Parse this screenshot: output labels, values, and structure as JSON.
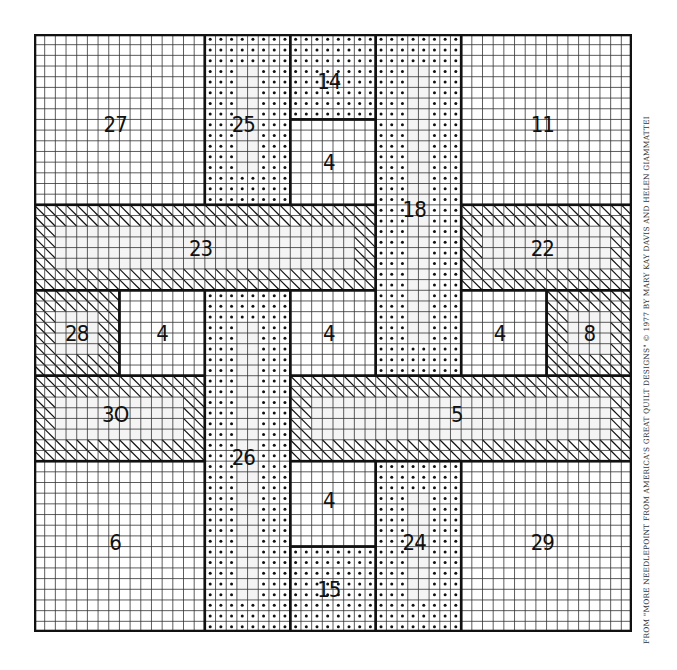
{
  "diagram": {
    "type": "needlepoint-chart",
    "grid": {
      "cells": 56,
      "block_cells": 8,
      "blocks": 7
    },
    "colors": {
      "ink": "#111111",
      "grid": "#333333",
      "fill": "#f4f4f4"
    },
    "regions": [
      {
        "id": "27",
        "label": "27",
        "pattern": "plain",
        "bx": 0,
        "by": 0,
        "bw": 2,
        "bh": 2,
        "lx": 0.95,
        "ly": 1.05
      },
      {
        "id": "25",
        "label": "25",
        "pattern": "dotted",
        "bx": 2,
        "by": 0,
        "bw": 1,
        "bh": 2,
        "lx": 2.45,
        "ly": 1.05
      },
      {
        "id": "14",
        "label": "14",
        "pattern": "dotted",
        "bx": 3,
        "by": 0,
        "bw": 1,
        "bh": 1,
        "lx": 3.45,
        "ly": 0.55
      },
      {
        "id": "4a",
        "label": "4",
        "pattern": "plain",
        "bx": 3,
        "by": 1,
        "bw": 1,
        "bh": 1,
        "lx": 3.45,
        "ly": 1.5
      },
      {
        "id": "18",
        "label": "18",
        "pattern": "dotted",
        "bx": 4,
        "by": 0,
        "bw": 1,
        "bh": 4,
        "lx": 4.45,
        "ly": 2.05
      },
      {
        "id": "11",
        "label": "11",
        "pattern": "plain",
        "bx": 5,
        "by": 0,
        "bw": 2,
        "bh": 2,
        "lx": 5.95,
        "ly": 1.05
      },
      {
        "id": "23",
        "label": "23",
        "pattern": "hatched",
        "bx": 0,
        "by": 2,
        "bw": 4,
        "bh": 1,
        "lx": 1.95,
        "ly": 2.5
      },
      {
        "id": "22",
        "label": "22",
        "pattern": "hatched",
        "bx": 5,
        "by": 2,
        "bw": 2,
        "bh": 1,
        "lx": 5.95,
        "ly": 2.5
      },
      {
        "id": "28",
        "label": "28",
        "pattern": "hatched",
        "bx": 0,
        "by": 3,
        "bw": 1,
        "bh": 1,
        "lx": 0.5,
        "ly": 3.5
      },
      {
        "id": "4b",
        "label": "4",
        "pattern": "plain",
        "bx": 1,
        "by": 3,
        "bw": 1,
        "bh": 1,
        "lx": 1.5,
        "ly": 3.5
      },
      {
        "id": "26",
        "label": "26",
        "pattern": "dotted",
        "bx": 2,
        "by": 3,
        "bw": 1,
        "bh": 4,
        "lx": 2.45,
        "ly": 4.95
      },
      {
        "id": "4c",
        "label": "4",
        "pattern": "plain",
        "bx": 3,
        "by": 3,
        "bw": 1,
        "bh": 1,
        "lx": 3.45,
        "ly": 3.5
      },
      {
        "id": "4d",
        "label": "4",
        "pattern": "plain",
        "bx": 5,
        "by": 3,
        "bw": 1,
        "bh": 1,
        "lx": 5.45,
        "ly": 3.5
      },
      {
        "id": "8",
        "label": "8",
        "pattern": "hatched",
        "bx": 6,
        "by": 3,
        "bw": 1,
        "bh": 1,
        "lx": 6.5,
        "ly": 3.5
      },
      {
        "id": "30",
        "label": "3O",
        "pattern": "hatched",
        "bx": 0,
        "by": 4,
        "bw": 2,
        "bh": 1,
        "lx": 0.95,
        "ly": 4.45
      },
      {
        "id": "5",
        "label": "5",
        "pattern": "hatched",
        "bx": 3,
        "by": 4,
        "bw": 4,
        "bh": 1,
        "lx": 4.95,
        "ly": 4.45
      },
      {
        "id": "6",
        "label": "6",
        "pattern": "plain",
        "bx": 0,
        "by": 5,
        "bw": 2,
        "bh": 2,
        "lx": 0.95,
        "ly": 5.95
      },
      {
        "id": "4e",
        "label": "4",
        "pattern": "plain",
        "bx": 3,
        "by": 5,
        "bw": 1,
        "bh": 1,
        "lx": 3.45,
        "ly": 5.45
      },
      {
        "id": "15",
        "label": "15",
        "pattern": "dotted",
        "bx": 3,
        "by": 6,
        "bw": 1,
        "bh": 1,
        "lx": 3.45,
        "ly": 6.5
      },
      {
        "id": "24",
        "label": "24",
        "pattern": "dotted",
        "bx": 4,
        "by": 5,
        "bw": 1,
        "bh": 2,
        "lx": 4.45,
        "ly": 5.95
      },
      {
        "id": "29",
        "label": "29",
        "pattern": "plain",
        "bx": 5,
        "by": 5,
        "bw": 2,
        "bh": 2,
        "lx": 5.95,
        "ly": 5.95
      }
    ]
  },
  "credit": "FROM \"MORE NEEDLEPOINT FROM AMERICA'S GREAT QUILT DESIGNS\" © 1977 BY MARY KAY DAVIS AND HELEN GIAMMATTEI"
}
